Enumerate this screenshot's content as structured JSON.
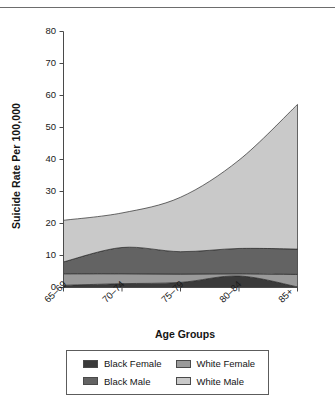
{
  "chart_data": {
    "type": "area",
    "stacked": true,
    "title": "",
    "subtitle": "",
    "xlabel": "Age Groups",
    "ylabel": "Suicide Rate Per 100,000",
    "categories": [
      "65–69",
      "70–74",
      "75–79",
      "80–84",
      "85+"
    ],
    "x_tick_labels": [
      "65–69",
      "70–74",
      "75–79",
      "80–84",
      "85+"
    ],
    "y_tick_labels": [
      "0",
      "10",
      "20",
      "30",
      "40",
      "50",
      "60",
      "70",
      "80"
    ],
    "y_ticks": [
      0,
      10,
      20,
      30,
      40,
      50,
      60,
      70,
      80
    ],
    "ylim": [
      0,
      80
    ],
    "grid": false,
    "legend_position": "bottom",
    "stack_order_bottom_to_top": [
      "Black Female",
      "White Female",
      "Black Male",
      "White Male"
    ],
    "series": [
      {
        "name": "Black Female",
        "color": "#3a3a3a",
        "values": [
          0.7,
          1.2,
          1.6,
          3.6,
          0.2
        ]
      },
      {
        "name": "White Female",
        "color": "#9a9a9a",
        "values": [
          3.6,
          3.1,
          2.6,
          0.7,
          3.9
        ]
      },
      {
        "name": "Black Male",
        "color": "#636363",
        "values": [
          3.7,
          8.2,
          7.0,
          7.9,
          7.9
        ]
      },
      {
        "name": "White Male",
        "color": "#c9c9c9",
        "values": [
          13.0,
          10.8,
          17.0,
          27.6,
          45.2
        ]
      }
    ],
    "cumulative_tops": {
      "black_female": [
        0.7,
        1.2,
        1.6,
        3.6,
        0.2
      ],
      "white_female": [
        4.3,
        4.3,
        4.2,
        4.3,
        4.1
      ],
      "black_male": [
        8.0,
        12.5,
        11.2,
        12.2,
        12.0
      ],
      "white_male": [
        21.0,
        23.3,
        28.2,
        39.8,
        57.2
      ]
    },
    "totals": [
      21.0,
      23.3,
      28.2,
      39.8,
      57.2
    ]
  },
  "axes": {
    "y_title": "Suicide Rate Per 100,000",
    "x_title": "Age Groups"
  },
  "legend": {
    "entries": [
      {
        "label": "Black Female",
        "color": "#3a3a3a"
      },
      {
        "label": "White Female",
        "color": "#9a9a9a"
      },
      {
        "label": "Black Male",
        "color": "#636363"
      },
      {
        "label": "White Male",
        "color": "#c9c9c9"
      }
    ]
  }
}
